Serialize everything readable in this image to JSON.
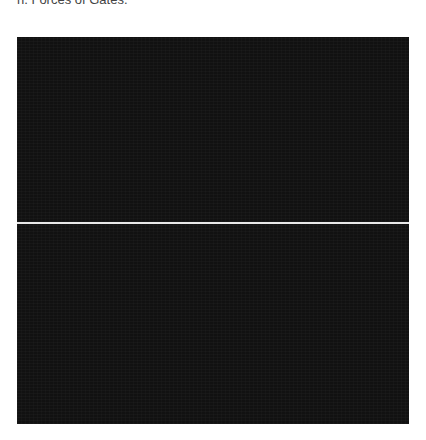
{
  "caption": {
    "text": "n. Forces of Gates."
  },
  "figure": {
    "panels": [
      {
        "name": "top-panel",
        "color": "#111111"
      },
      {
        "name": "bottom-panel",
        "color": "#111111"
      }
    ],
    "divider_color": "#e8e8e8",
    "background": "#ffffff"
  }
}
